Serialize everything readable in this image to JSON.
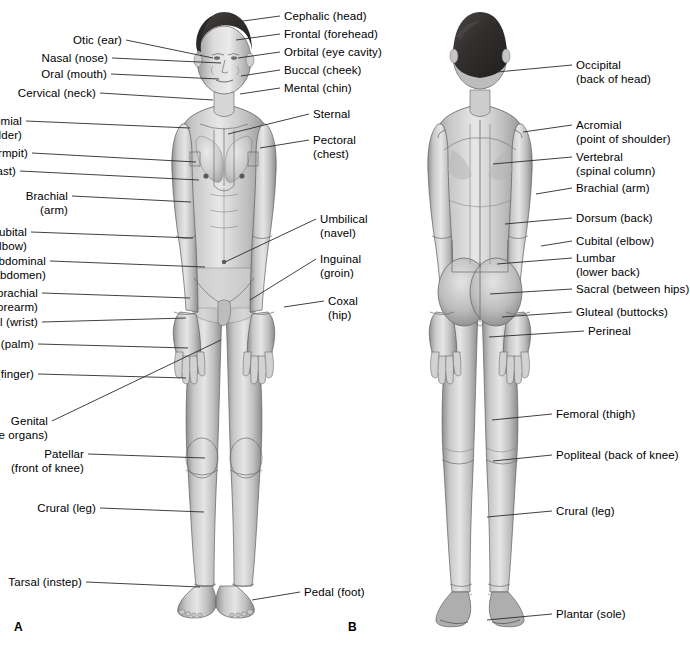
{
  "figure": {
    "panels": [
      {
        "letter": "A",
        "view": "anterior",
        "x": 14,
        "y": 620
      },
      {
        "letter": "B",
        "view": "posterior",
        "x": 348,
        "y": 620
      }
    ]
  },
  "colors": {
    "background": "#ffffff",
    "text": "#000000",
    "leader_line": "#2b2b2b",
    "skin_light": "#e3e3e3",
    "skin_mid": "#c4c4c4",
    "skin_dark": "#9a9a9a",
    "shadow": "#6e6e6e",
    "hair": "#2e2c2c"
  },
  "anterior_labels_left": [
    {
      "id": "otic",
      "text": "Otic (ear)",
      "x": 122,
      "y": 40,
      "tip_x": 213,
      "tip_y": 58
    },
    {
      "id": "nasal",
      "text": "Nasal (nose)",
      "x": 108,
      "y": 58,
      "tip_x": 221,
      "tip_y": 63
    },
    {
      "id": "oral",
      "text": "Oral (mouth)",
      "x": 107,
      "y": 74,
      "tip_x": 219,
      "tip_y": 79
    },
    {
      "id": "cervical",
      "text": "Cervical (neck)",
      "x": 96,
      "y": 93,
      "tip_x": 213,
      "tip_y": 100
    },
    {
      "id": "acromial",
      "text": "Acromial\n(point of shoulder)",
      "x": 22,
      "y": 121,
      "tip_x": 190,
      "tip_y": 128
    },
    {
      "id": "axillary",
      "text": "Axillary (armpit)",
      "x": 28,
      "y": 153,
      "tip_x": 196,
      "tip_y": 162
    },
    {
      "id": "mammary",
      "text": "Mammary (breast)",
      "x": 16,
      "y": 171,
      "tip_x": 199,
      "tip_y": 180
    },
    {
      "id": "brachial",
      "text": "Brachial\n(arm)",
      "x": 68,
      "y": 196,
      "tip_x": 191,
      "tip_y": 202
    },
    {
      "id": "antecubital",
      "text": "Antecubital\n(front of elbow)",
      "x": 27,
      "y": 232,
      "tip_x": 193,
      "tip_y": 238
    },
    {
      "id": "abdominal",
      "text": "Abdominal\n(abdomen)",
      "x": 46,
      "y": 261,
      "tip_x": 205,
      "tip_y": 267
    },
    {
      "id": "antebrachial",
      "text": "Antebrachial\n(forearm)",
      "x": 38,
      "y": 293,
      "tip_x": 190,
      "tip_y": 298
    },
    {
      "id": "carpal",
      "text": "Carpal (wrist)",
      "x": 38,
      "y": 322,
      "tip_x": 186,
      "tip_y": 318
    },
    {
      "id": "palmar",
      "text": "Palmar (palm)",
      "x": 34,
      "y": 344,
      "tip_x": 188,
      "tip_y": 348
    },
    {
      "id": "digital",
      "text": "Digital (finger)",
      "x": 34,
      "y": 374,
      "tip_x": 186,
      "tip_y": 378
    },
    {
      "id": "genital",
      "text": "Genital\n(reproductive organs)",
      "x": 48,
      "y": 421,
      "tip_x": 221,
      "tip_y": 340
    },
    {
      "id": "patellar",
      "text": "Patellar\n(front of knee)",
      "x": 84,
      "y": 454,
      "tip_x": 205,
      "tip_y": 458
    },
    {
      "id": "crural_ant",
      "text": "Crural (leg)",
      "x": 96,
      "y": 508,
      "tip_x": 204,
      "tip_y": 512
    },
    {
      "id": "tarsal",
      "text": "Tarsal (instep)",
      "x": 82,
      "y": 582,
      "tip_x": 200,
      "tip_y": 587
    }
  ],
  "anterior_labels_right": [
    {
      "id": "cephalic",
      "text": "Cephalic (head)",
      "x": 284,
      "y": 16,
      "tip_x": 236,
      "tip_y": 22
    },
    {
      "id": "frontal",
      "text": "Frontal (forehead)",
      "x": 284,
      "y": 34,
      "tip_x": 236,
      "tip_y": 40
    },
    {
      "id": "orbital",
      "text": "Orbital (eye cavity)",
      "x": 284,
      "y": 52,
      "tip_x": 238,
      "tip_y": 58
    },
    {
      "id": "buccal",
      "text": "Buccal (cheek)",
      "x": 284,
      "y": 70,
      "tip_x": 241,
      "tip_y": 76
    },
    {
      "id": "mental",
      "text": "Mental (chin)",
      "x": 284,
      "y": 88,
      "tip_x": 240,
      "tip_y": 94
    },
    {
      "id": "sternal",
      "text": "Sternal",
      "x": 313,
      "y": 114,
      "tip_x": 228,
      "tip_y": 134
    },
    {
      "id": "pectoral",
      "text": "Pectoral\n(chest)",
      "x": 313,
      "y": 140,
      "tip_x": 260,
      "tip_y": 148
    },
    {
      "id": "umbilical",
      "text": "Umbilical\n(navel)",
      "x": 320,
      "y": 219,
      "tip_x": 225,
      "tip_y": 262
    },
    {
      "id": "inguinal",
      "text": "Inguinal\n(groin)",
      "x": 320,
      "y": 259,
      "tip_x": 250,
      "tip_y": 300
    },
    {
      "id": "coxal",
      "text": "Coxal\n(hip)",
      "x": 328,
      "y": 301,
      "tip_x": 284,
      "tip_y": 307
    },
    {
      "id": "pedal",
      "text": "Pedal (foot)",
      "x": 304,
      "y": 592,
      "tip_x": 252,
      "tip_y": 600
    }
  ],
  "posterior_labels_right": [
    {
      "id": "occipital",
      "text": "Occipital\n(back of head)",
      "x": 576,
      "y": 65,
      "tip_x": 497,
      "tip_y": 72
    },
    {
      "id": "acromial_p",
      "text": "Acromial\n(point of shoulder)",
      "x": 576,
      "y": 125,
      "tip_x": 523,
      "tip_y": 132
    },
    {
      "id": "vertebral",
      "text": "Vertebral\n(spinal column)",
      "x": 576,
      "y": 157,
      "tip_x": 493,
      "tip_y": 164
    },
    {
      "id": "brachial_p",
      "text": "Brachial (arm)",
      "x": 576,
      "y": 188,
      "tip_x": 536,
      "tip_y": 194
    },
    {
      "id": "dorsum",
      "text": "Dorsum (back)",
      "x": 576,
      "y": 218,
      "tip_x": 505,
      "tip_y": 224
    },
    {
      "id": "cubital",
      "text": "Cubital (elbow)",
      "x": 576,
      "y": 241,
      "tip_x": 541,
      "tip_y": 246
    },
    {
      "id": "lumbar",
      "text": "Lumbar\n(lower back)",
      "x": 576,
      "y": 258,
      "tip_x": 497,
      "tip_y": 264
    },
    {
      "id": "sacral",
      "text": "Sacral (between hips)",
      "x": 576,
      "y": 289,
      "tip_x": 490,
      "tip_y": 294
    },
    {
      "id": "gluteal",
      "text": "Gluteal (buttocks)",
      "x": 576,
      "y": 312,
      "tip_x": 502,
      "tip_y": 317
    },
    {
      "id": "perineal",
      "text": "Perineal",
      "x": 588,
      "y": 331,
      "tip_x": 489,
      "tip_y": 337
    },
    {
      "id": "femoral",
      "text": "Femoral (thigh)",
      "x": 556,
      "y": 414,
      "tip_x": 492,
      "tip_y": 420
    },
    {
      "id": "popliteal",
      "text": "Popliteal (back of knee)",
      "x": 556,
      "y": 455,
      "tip_x": 493,
      "tip_y": 461
    },
    {
      "id": "crural_post",
      "text": "Crural (leg)",
      "x": 556,
      "y": 511,
      "tip_x": 487,
      "tip_y": 517
    },
    {
      "id": "plantar",
      "text": "Plantar (sole)",
      "x": 556,
      "y": 614,
      "tip_x": 487,
      "tip_y": 620
    }
  ]
}
